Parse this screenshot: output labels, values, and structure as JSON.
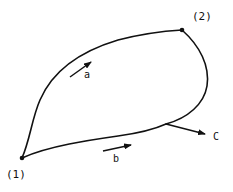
{
  "diagram": {
    "type": "closed-curve-path-diagram",
    "stroke_color": "#111111",
    "background": "#ffffff",
    "points": [
      {
        "id": "p1",
        "label": "(1)"
      },
      {
        "id": "p2",
        "label": "(2)"
      }
    ],
    "paths": [
      {
        "id": "a",
        "label": "a",
        "description": "upper path from (1) to (2)"
      },
      {
        "id": "b",
        "label": "b",
        "description": "lower path from (1) to (2)"
      }
    ],
    "arrows": [
      {
        "id": "arrow-a",
        "label": "a"
      },
      {
        "id": "arrow-b",
        "label": "b"
      },
      {
        "id": "arrow-c",
        "label": "C"
      }
    ]
  }
}
